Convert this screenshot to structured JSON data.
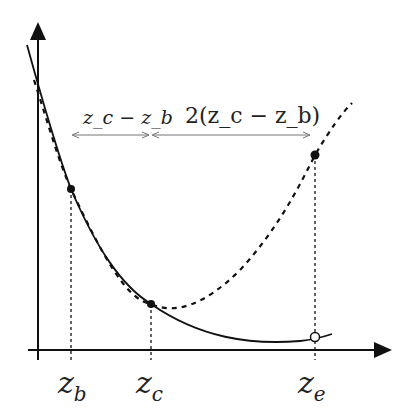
{
  "diagram": {
    "title": "",
    "annotations": {
      "interval1": "z_c − z_b",
      "interval2": "2(z_c − z_b)"
    },
    "axis_labels": {
      "zb": {
        "main": "z",
        "sub": "b"
      },
      "zc": {
        "main": "z",
        "sub": "c"
      },
      "ze": {
        "main": "z",
        "sub": "e"
      }
    },
    "colors": {
      "ink": "#111111",
      "arrow": "#777777"
    }
  }
}
